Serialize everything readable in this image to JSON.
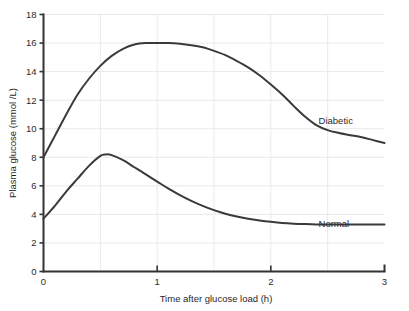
{
  "chart_data": {
    "type": "line",
    "title": "",
    "xlabel": "Time after glucose load (h)",
    "ylabel": "Plasma glucose (mmol /L)",
    "xlim": [
      0,
      3
    ],
    "ylim": [
      0,
      18
    ],
    "grid": true,
    "legend_position": "inline-right",
    "x_ticks": [
      0,
      1,
      2,
      3
    ],
    "x_tick_labels": [
      "0",
      "1",
      "2",
      "3"
    ],
    "x_gridlines": [
      0.5,
      1,
      1.5,
      2,
      2.5
    ],
    "y_ticks": [
      0,
      2,
      4,
      6,
      8,
      10,
      12,
      14,
      16,
      18
    ],
    "y_tick_labels": [
      "0",
      "2",
      "4",
      "6",
      "8",
      "10",
      "12",
      "14",
      "16",
      "18"
    ],
    "y_gridlines": [
      2,
      4,
      6,
      8,
      10,
      12,
      14,
      16,
      18
    ],
    "series": [
      {
        "name": "Diabetic",
        "color": "#3a3a3a",
        "label_x": 2.42,
        "label_y": 10.3,
        "x": [
          0,
          0.1,
          0.2,
          0.3,
          0.4,
          0.5,
          0.6,
          0.7,
          0.8,
          0.9,
          1.0,
          1.1,
          1.2,
          1.3,
          1.4,
          1.5,
          1.6,
          1.7,
          1.8,
          1.9,
          2.0,
          2.1,
          2.2,
          2.3,
          2.4,
          2.5,
          2.6,
          2.7,
          2.8,
          2.9,
          3.0
        ],
        "values": [
          8.0,
          9.5,
          11.0,
          12.4,
          13.5,
          14.4,
          15.1,
          15.6,
          15.9,
          16.0,
          16.0,
          16.0,
          15.95,
          15.85,
          15.7,
          15.45,
          15.15,
          14.75,
          14.3,
          13.75,
          13.1,
          12.4,
          11.6,
          10.85,
          10.25,
          9.9,
          9.7,
          9.55,
          9.4,
          9.2,
          9.0
        ]
      },
      {
        "name": "Normal",
        "color": "#3a3a3a",
        "label_x": 2.42,
        "label_y": 3.15,
        "x": [
          0,
          0.1,
          0.2,
          0.3,
          0.4,
          0.5,
          0.55,
          0.6,
          0.7,
          0.8,
          0.9,
          1.0,
          1.1,
          1.2,
          1.3,
          1.4,
          1.5,
          1.6,
          1.7,
          1.8,
          1.9,
          2.0,
          2.1,
          2.2,
          2.3,
          2.4,
          2.5,
          2.6,
          2.7,
          2.8,
          2.9,
          3.0
        ],
        "values": [
          3.7,
          4.6,
          5.6,
          6.5,
          7.4,
          8.1,
          8.2,
          8.15,
          7.8,
          7.3,
          6.8,
          6.3,
          5.8,
          5.35,
          4.95,
          4.6,
          4.3,
          4.05,
          3.85,
          3.7,
          3.58,
          3.48,
          3.4,
          3.35,
          3.32,
          3.3,
          3.3,
          3.3,
          3.3,
          3.3,
          3.3,
          3.3
        ]
      }
    ],
    "style": {
      "axis_color": "#333333",
      "grid_color": "#e9e9e9",
      "background": "#ffffff",
      "line_width": 2
    }
  }
}
